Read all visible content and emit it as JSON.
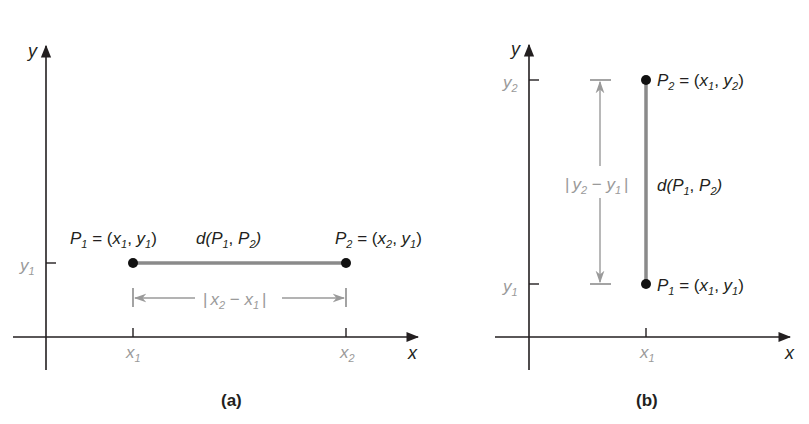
{
  "panels": [
    {
      "caption": "(a)",
      "axes": {
        "x_label": "x",
        "y_label": "y"
      },
      "ticks": {
        "y": "y",
        "y_sub": "1",
        "x1": "x",
        "x1_sub": "1",
        "x2": "x",
        "x2_sub": "2"
      },
      "points": {
        "p1": {
          "name": "P",
          "sub": "1",
          "eq": " = (",
          "a": "x",
          "a_sub": "1",
          "comma": ", ",
          "b": "y",
          "b_sub": "1",
          "close": ")"
        },
        "p2": {
          "name": "P",
          "sub": "2",
          "eq": " = (",
          "a": "x",
          "a_sub": "2",
          "comma": ", ",
          "b": "y",
          "b_sub": "1",
          "close": ")"
        }
      },
      "distance": {
        "d": "d(",
        "p": "P",
        "p1_sub": "1",
        "mid": ", ",
        "p2_sub": "2",
        "close": ")"
      },
      "dimension": {
        "bar": "|",
        "a": "x",
        "a_sub": "2",
        "minus": " − ",
        "b": "x",
        "b_sub": "1"
      }
    },
    {
      "caption": "(b)",
      "axes": {
        "x_label": "x",
        "y_label": "y"
      },
      "ticks": {
        "y1": "y",
        "y1_sub": "1",
        "y2": "y",
        "y2_sub": "2",
        "x1": "x",
        "x1_sub": "1"
      },
      "points": {
        "p1": {
          "name": "P",
          "sub": "1",
          "eq": " = (",
          "a": "x",
          "a_sub": "1",
          "comma": ", ",
          "b": "y",
          "b_sub": "1",
          "close": ")"
        },
        "p2": {
          "name": "P",
          "sub": "2",
          "eq": " = (",
          "a": "x",
          "a_sub": "1",
          "comma": ", ",
          "b": "y",
          "b_sub": "2",
          "close": ")"
        }
      },
      "distance": {
        "d": "d(",
        "p": "P",
        "p1_sub": "1",
        "mid": ", ",
        "p2_sub": "2",
        "close": ")"
      },
      "dimension": {
        "bar": "|",
        "a": "y",
        "a_sub": "2",
        "minus": " − ",
        "b": "y",
        "b_sub": "1"
      }
    }
  ],
  "colors": {
    "segment": "#8a8a8a",
    "dimension": "#9a9a9a",
    "axis": "#231f20",
    "point": "#111111"
  }
}
